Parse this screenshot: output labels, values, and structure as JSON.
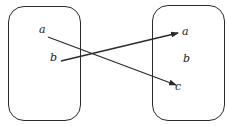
{
  "diagram": {
    "type": "function-mapping",
    "domain_set": {
      "elements": [
        "a",
        "b"
      ]
    },
    "codomain_set": {
      "elements": [
        "a",
        "b",
        "c"
      ]
    },
    "mappings": [
      {
        "from": "a",
        "to": "c"
      },
      {
        "from": "b",
        "to": "a"
      }
    ],
    "colors": {
      "stroke": "#2a2a2a",
      "text": "#222222",
      "background": "#ffffff"
    }
  }
}
